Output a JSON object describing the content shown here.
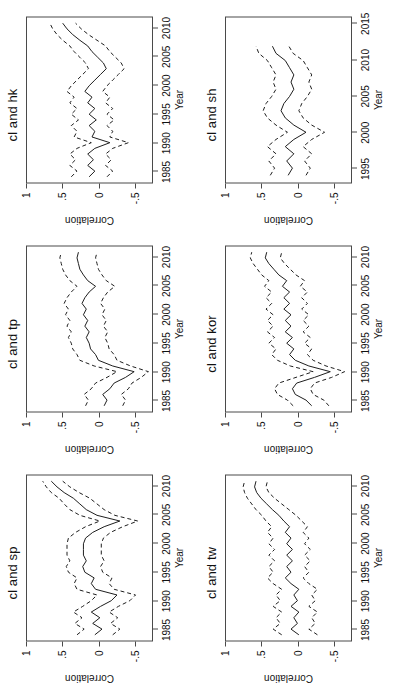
{
  "figure": {
    "ylabel": "Correlation",
    "xlabel": "Year",
    "ylim": [
      -0.75,
      1.0
    ],
    "ytick_labels": [
      "1",
      ".5",
      "0",
      "-.5"
    ],
    "ytick_values": [
      1,
      0.5,
      0,
      -0.5
    ],
    "line_color": "#1a1a1a",
    "box_color": "#4a4a4a"
  },
  "chart_data": [
    {
      "type": "line",
      "title": "cl and sp",
      "xlabel": "Year",
      "ylabel": "Correlation",
      "xlim": [
        1983,
        2012
      ],
      "ylim": [
        -0.75,
        1.0
      ],
      "xtick_labels": [
        "1985",
        "1990",
        "1995",
        "2000",
        "2005",
        "2010"
      ],
      "xtick_values": [
        1985,
        1990,
        1995,
        2000,
        2005,
        2010
      ],
      "grid": false,
      "legend": "none",
      "x": [
        1984,
        1985,
        1986,
        1987,
        1988,
        1989,
        1990,
        1991,
        1992,
        1993,
        1994,
        1995,
        1996,
        1997,
        1998,
        1999,
        2000,
        2001,
        2002,
        2003,
        2004,
        2005,
        2006,
        2007,
        2008,
        2009,
        2010,
        2011
      ],
      "series": [
        {
          "name": "upper",
          "style": "dashed",
          "values": [
            0.3,
            0.2,
            0.33,
            0.23,
            0.35,
            0.22,
            0.1,
            0.02,
            0.3,
            0.34,
            0.3,
            0.42,
            0.45,
            0.4,
            0.44,
            0.44,
            0.44,
            0.42,
            0.32,
            0.18,
            -0.02,
            0.26,
            0.4,
            0.48,
            0.55,
            0.66,
            0.73,
            0.78
          ]
        },
        {
          "name": "mean",
          "style": "solid",
          "values": [
            0.05,
            -0.05,
            0.08,
            -0.02,
            0.1,
            -0.03,
            -0.18,
            -0.26,
            0.04,
            0.1,
            0.06,
            0.19,
            0.22,
            0.17,
            0.21,
            0.21,
            0.21,
            0.18,
            0.08,
            -0.08,
            -0.3,
            0.02,
            0.17,
            0.26,
            0.35,
            0.48,
            0.58,
            0.66
          ]
        },
        {
          "name": "lower",
          "style": "dashed",
          "values": [
            -0.2,
            -0.3,
            -0.17,
            -0.27,
            -0.15,
            -0.28,
            -0.44,
            -0.52,
            -0.22,
            -0.15,
            -0.19,
            -0.06,
            -0.03,
            -0.08,
            -0.04,
            -0.04,
            -0.04,
            -0.07,
            -0.17,
            -0.34,
            -0.55,
            -0.23,
            -0.08,
            0.02,
            0.12,
            0.27,
            0.4,
            0.5
          ]
        }
      ]
    },
    {
      "type": "line",
      "title": "cl and tp",
      "xlabel": "Year",
      "ylabel": "Correlation",
      "xlim": [
        1983,
        2012
      ],
      "ylim": [
        -0.75,
        1.0
      ],
      "xtick_labels": [
        "1985",
        "1990",
        "1995",
        "2000",
        "2005",
        "2010"
      ],
      "xtick_values": [
        1985,
        1990,
        1995,
        2000,
        2005,
        2010
      ],
      "grid": false,
      "legend": "none",
      "x": [
        1984,
        1985,
        1986,
        1987,
        1988,
        1989,
        1990,
        1991,
        1992,
        1993,
        1994,
        1995,
        1996,
        1997,
        1998,
        1999,
        2000,
        2001,
        2002,
        2003,
        2004,
        2005,
        2006,
        2007,
        2008,
        2009,
        2010,
        2011
      ],
      "series": [
        {
          "name": "upper",
          "style": "dashed",
          "values": [
            0.18,
            0.14,
            0.2,
            0.1,
            0.04,
            -0.12,
            -0.26,
            0.06,
            0.26,
            0.3,
            0.36,
            0.38,
            0.42,
            0.38,
            0.44,
            0.4,
            0.46,
            0.42,
            0.48,
            0.44,
            0.38,
            0.3,
            0.4,
            0.46,
            0.5,
            0.52,
            0.54,
            0.52
          ]
        },
        {
          "name": "mean",
          "style": "solid",
          "values": [
            -0.08,
            -0.12,
            -0.06,
            -0.16,
            -0.22,
            -0.38,
            -0.5,
            -0.2,
            0.0,
            0.04,
            0.11,
            0.13,
            0.17,
            0.13,
            0.19,
            0.15,
            0.21,
            0.17,
            0.23,
            0.19,
            0.13,
            0.04,
            0.15,
            0.21,
            0.26,
            0.28,
            0.3,
            0.28
          ]
        },
        {
          "name": "lower",
          "style": "dashed",
          "values": [
            -0.34,
            -0.38,
            -0.32,
            -0.42,
            -0.47,
            -0.6,
            -0.7,
            -0.45,
            -0.26,
            -0.22,
            -0.15,
            -0.13,
            -0.09,
            -0.13,
            -0.07,
            -0.11,
            -0.05,
            -0.09,
            -0.03,
            -0.07,
            -0.13,
            -0.23,
            -0.11,
            -0.05,
            0.0,
            0.02,
            0.04,
            0.02
          ]
        }
      ]
    },
    {
      "type": "line",
      "title": "cl and hk",
      "xlabel": "Year",
      "ylabel": "Correlation",
      "xlim": [
        1983,
        2012
      ],
      "ylim": [
        -0.75,
        1.0
      ],
      "xtick_labels": [
        "1985",
        "1990",
        "1995",
        "2000",
        "2005",
        "2010"
      ],
      "xtick_values": [
        1985,
        1990,
        1995,
        2000,
        2005,
        2010
      ],
      "grid": false,
      "legend": "none",
      "x": [
        1984,
        1985,
        1986,
        1987,
        1988,
        1989,
        1990,
        1991,
        1992,
        1993,
        1994,
        1995,
        1996,
        1997,
        1998,
        1999,
        2000,
        2001,
        2002,
        2003,
        2004,
        2005,
        2006,
        2007,
        2008,
        2009,
        2010,
        2011
      ],
      "series": [
        {
          "name": "upper",
          "style": "dashed",
          "values": [
            0.38,
            0.3,
            0.4,
            0.32,
            0.4,
            0.3,
            0.1,
            0.34,
            0.3,
            0.38,
            0.28,
            0.38,
            0.3,
            0.4,
            0.34,
            0.44,
            0.38,
            0.3,
            0.22,
            0.14,
            0.18,
            0.26,
            0.34,
            0.4,
            0.5,
            0.58,
            0.64,
            0.68
          ]
        },
        {
          "name": "mean",
          "style": "solid",
          "values": [
            0.13,
            0.05,
            0.15,
            0.07,
            0.15,
            0.05,
            -0.16,
            0.09,
            0.05,
            0.13,
            0.03,
            0.13,
            0.05,
            0.15,
            0.09,
            0.19,
            0.13,
            0.05,
            -0.03,
            -0.11,
            -0.07,
            0.01,
            0.09,
            0.15,
            0.26,
            0.36,
            0.44,
            0.5
          ]
        },
        {
          "name": "lower",
          "style": "dashed",
          "values": [
            -0.12,
            -0.2,
            -0.1,
            -0.18,
            -0.1,
            -0.2,
            -0.42,
            -0.16,
            -0.2,
            -0.12,
            -0.22,
            -0.12,
            -0.2,
            -0.1,
            -0.16,
            -0.06,
            -0.12,
            -0.2,
            -0.28,
            -0.36,
            -0.32,
            -0.24,
            -0.16,
            -0.1,
            0.02,
            0.14,
            0.24,
            0.32
          ]
        }
      ]
    },
    {
      "type": "line",
      "title": "cl and tw",
      "xlabel": "Year",
      "ylabel": "Correlation",
      "xlim": [
        1983,
        2012
      ],
      "ylim": [
        -0.75,
        1.0
      ],
      "xtick_labels": [
        "1985",
        "1990",
        "1995",
        "2000",
        "2005",
        "2010"
      ],
      "xtick_values": [
        1985,
        1990,
        1995,
        2000,
        2005,
        2010
      ],
      "grid": false,
      "legend": "none",
      "x": [
        1984,
        1985,
        1986,
        1987,
        1988,
        1989,
        1990,
        1991,
        1992,
        1993,
        1994,
        1995,
        1996,
        1997,
        1998,
        1999,
        2000,
        2001,
        2002,
        2003,
        2004,
        2005,
        2006,
        2007,
        2008,
        2009,
        2010,
        2011
      ],
      "series": [
        {
          "name": "upper",
          "style": "dashed",
          "values": [
            0.22,
            0.34,
            0.24,
            0.3,
            0.22,
            0.34,
            0.24,
            0.3,
            0.22,
            0.34,
            0.42,
            0.34,
            0.4,
            0.32,
            0.4,
            0.32,
            0.4,
            0.34,
            0.42,
            0.36,
            0.44,
            0.5,
            0.58,
            0.64,
            0.7,
            0.74,
            0.76,
            0.74
          ]
        },
        {
          "name": "mean",
          "style": "solid",
          "values": [
            -0.02,
            0.09,
            0.0,
            0.05,
            -0.02,
            0.09,
            0.0,
            0.05,
            -0.02,
            0.09,
            0.17,
            0.09,
            0.15,
            0.07,
            0.15,
            0.07,
            0.15,
            0.09,
            0.17,
            0.11,
            0.19,
            0.26,
            0.35,
            0.43,
            0.51,
            0.57,
            0.6,
            0.58
          ]
        },
        {
          "name": "lower",
          "style": "dashed",
          "values": [
            -0.28,
            -0.16,
            -0.25,
            -0.2,
            -0.28,
            -0.16,
            -0.25,
            -0.2,
            -0.28,
            -0.16,
            -0.08,
            -0.16,
            -0.1,
            -0.18,
            -0.1,
            -0.18,
            -0.1,
            -0.16,
            -0.08,
            -0.14,
            -0.06,
            0.02,
            0.12,
            0.22,
            0.32,
            0.4,
            0.44,
            0.42
          ]
        }
      ]
    },
    {
      "type": "line",
      "title": "cl and kor",
      "xlabel": "Year",
      "ylabel": "Correlation",
      "xlim": [
        1983,
        2012
      ],
      "ylim": [
        -0.75,
        1.0
      ],
      "xtick_labels": [
        "1985",
        "1990",
        "1995",
        "2000",
        "2005",
        "2010"
      ],
      "xtick_values": [
        1985,
        1990,
        1995,
        2000,
        2005,
        2010
      ],
      "grid": false,
      "legend": "none",
      "x": [
        1984,
        1985,
        1986,
        1987,
        1988,
        1989,
        1990,
        1991,
        1992,
        1993,
        1994,
        1995,
        1996,
        1997,
        1998,
        1999,
        2000,
        2001,
        2002,
        2003,
        2004,
        2005,
        2006,
        2007,
        2008,
        2009,
        2010,
        2011
      ],
      "series": [
        {
          "name": "upper",
          "style": "dashed",
          "values": [
            0.06,
            0.14,
            0.28,
            0.32,
            0.26,
            0.02,
            -0.22,
            0.1,
            0.28,
            0.36,
            0.3,
            0.4,
            0.32,
            0.42,
            0.34,
            0.42,
            0.34,
            0.44,
            0.36,
            0.44,
            0.36,
            0.46,
            0.4,
            0.5,
            0.56,
            0.62,
            0.66,
            0.64
          ]
        },
        {
          "name": "mean",
          "style": "solid",
          "values": [
            -0.2,
            -0.12,
            0.03,
            0.07,
            0.01,
            -0.24,
            -0.46,
            -0.16,
            0.03,
            0.11,
            0.05,
            0.15,
            0.07,
            0.17,
            0.09,
            0.17,
            0.09,
            0.19,
            0.11,
            0.19,
            0.11,
            0.21,
            0.15,
            0.26,
            0.33,
            0.4,
            0.45,
            0.43
          ]
        },
        {
          "name": "lower",
          "style": "dashed",
          "values": [
            -0.44,
            -0.37,
            -0.22,
            -0.18,
            -0.24,
            -0.48,
            -0.66,
            -0.4,
            -0.22,
            -0.14,
            -0.2,
            -0.1,
            -0.18,
            -0.08,
            -0.16,
            -0.08,
            -0.16,
            -0.06,
            -0.14,
            -0.06,
            -0.14,
            -0.04,
            -0.1,
            0.02,
            0.1,
            0.18,
            0.24,
            0.22
          ]
        }
      ]
    },
    {
      "type": "line",
      "title": "cl and sh",
      "xlabel": "Year",
      "ylabel": "Correlation",
      "xlim": [
        1993,
        2016
      ],
      "ylim": [
        -0.75,
        1.0
      ],
      "xtick_labels": [
        "1995",
        "2000",
        "2005",
        "2010",
        "2015"
      ],
      "xtick_values": [
        1995,
        2000,
        2005,
        2010,
        2015
      ],
      "grid": false,
      "legend": "none",
      "x": [
        1994,
        1995,
        1996,
        1997,
        1998,
        1999,
        2000,
        2001,
        2002,
        2003,
        2004,
        2005,
        2006,
        2007,
        2008,
        2009,
        2010,
        2011,
        2012
      ],
      "series": [
        {
          "name": "upper",
          "style": "dashed",
          "values": [
            0.38,
            0.32,
            0.4,
            0.3,
            0.42,
            0.3,
            0.14,
            0.3,
            0.42,
            0.48,
            0.44,
            0.36,
            0.3,
            0.34,
            0.3,
            0.36,
            0.42,
            0.54,
            0.58
          ]
        },
        {
          "name": "mean",
          "style": "solid",
          "values": [
            0.13,
            0.07,
            0.15,
            0.05,
            0.17,
            0.05,
            -0.12,
            0.05,
            0.17,
            0.23,
            0.19,
            0.11,
            0.05,
            0.09,
            0.05,
            0.11,
            0.17,
            0.3,
            0.35
          ]
        },
        {
          "name": "lower",
          "style": "dashed",
          "values": [
            -0.12,
            -0.18,
            -0.1,
            -0.2,
            -0.08,
            -0.2,
            -0.38,
            -0.2,
            -0.08,
            -0.02,
            -0.06,
            -0.14,
            -0.2,
            -0.16,
            -0.2,
            -0.14,
            -0.08,
            0.06,
            0.12
          ]
        }
      ]
    }
  ]
}
